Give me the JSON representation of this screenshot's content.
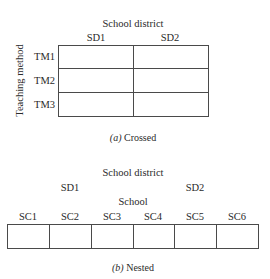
{
  "crossed": {
    "column_factor": "School district",
    "columns": [
      "SD1",
      "SD2"
    ],
    "row_factor": "Teaching method",
    "rows": [
      "TM1",
      "TM2",
      "TM3"
    ],
    "caption_label": "(a)",
    "caption_text": "Crossed"
  },
  "nested": {
    "outer_factor": "School district",
    "outer_levels": [
      "SD1",
      "SD2"
    ],
    "inner_factor": "School",
    "inner_levels": [
      "SC1",
      "SC2",
      "SC3",
      "SC4",
      "SC5",
      "SC6"
    ],
    "caption_label": "(b)",
    "caption_text": "Nested"
  }
}
